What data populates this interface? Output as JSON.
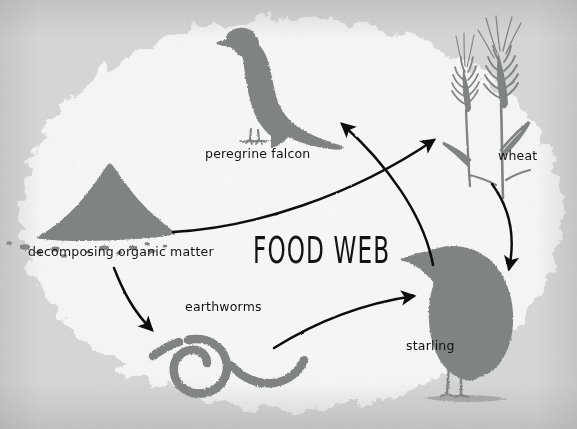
{
  "diagram": {
    "title": "FOOD WEB",
    "background_color": "#d6d8d6",
    "paper_color": "#f6f6f4",
    "silhouette_color": "#7f8480",
    "arrow_color": "#111111",
    "text_color": "#131313",
    "nodes": [
      {
        "id": "falcon",
        "label": "peregrine falcon",
        "icon": "peregrine-falcon-silhouette",
        "x": 265,
        "y": 80
      },
      {
        "id": "wheat",
        "label": "wheat",
        "icon": "wheat-stalks-silhouette",
        "x": 495,
        "y": 95
      },
      {
        "id": "compost",
        "label": "decomposing organic matter",
        "icon": "compost-pile-silhouette",
        "x": 100,
        "y": 200
      },
      {
        "id": "worms",
        "label": "earthworms",
        "icon": "earthworm-silhouette",
        "x": 225,
        "y": 365
      },
      {
        "id": "starling",
        "label": "starling",
        "icon": "starling-silhouette",
        "x": 480,
        "y": 310
      }
    ],
    "arrows": [
      {
        "id": "compost-to-wheat",
        "from": "compost",
        "to": "wheat",
        "shape": "long-shallow-curve-up-right"
      },
      {
        "id": "compost-to-worms",
        "from": "compost",
        "to": "worms",
        "shape": "curve-down-right"
      },
      {
        "id": "wheat-to-starling",
        "from": "wheat",
        "to": "starling",
        "shape": "curve-down"
      },
      {
        "id": "worms-to-starling",
        "from": "worms",
        "to": "starling",
        "shape": "curve-up-right"
      },
      {
        "id": "starling-to-falcon",
        "from": "starling",
        "to": "falcon",
        "shape": "curve-up-left"
      }
    ]
  }
}
